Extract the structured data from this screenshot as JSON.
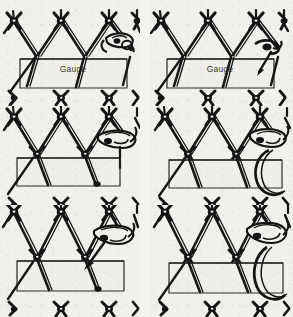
{
  "figure": {
    "type": "instructional-diagram",
    "background_color": "#f1f0ec",
    "ink_color": "#1a1a1a",
    "columns": 2,
    "rows": 3,
    "panel_count": 6
  },
  "panels": [
    {
      "id": "step-1",
      "position": "top-left",
      "gauge_label": "Gauge",
      "shows_gauge_label": true,
      "shuttle": {
        "present": true,
        "position": "right",
        "style": "flat-needle"
      },
      "arrow": {
        "present": false
      },
      "loop_around_gauge": false,
      "mesh_columns": 3,
      "bottom_knot_row": true
    },
    {
      "id": "step-2",
      "position": "top-right",
      "gauge_label": "Gauge",
      "shows_gauge_label": true,
      "shuttle": {
        "present": false
      },
      "arrow": {
        "present": true,
        "direction": "down-left",
        "note": "thread pulled down through loop"
      },
      "loop_around_gauge": false,
      "mesh_columns": 3,
      "bottom_knot_row": true
    },
    {
      "id": "step-3",
      "position": "middle-left",
      "gauge_label": "",
      "shows_gauge_label": false,
      "shuttle": {
        "present": true,
        "position": "upper-right",
        "style": "flat-needle"
      },
      "arrow": {
        "present": false
      },
      "loop_around_gauge": false,
      "mesh_columns": 3,
      "bottom_knot_row": true
    },
    {
      "id": "step-4",
      "position": "middle-right",
      "gauge_label": "",
      "shows_gauge_label": false,
      "shuttle": {
        "present": true,
        "position": "upper-right",
        "style": "flat-needle"
      },
      "arrow": {
        "present": false
      },
      "loop_around_gauge": true,
      "mesh_columns": 3,
      "bottom_knot_row": true
    },
    {
      "id": "step-5",
      "position": "bottom-left",
      "gauge_label": "",
      "shows_gauge_label": false,
      "shuttle": {
        "present": true,
        "position": "upper-right",
        "style": "flat-needle"
      },
      "arrow": {
        "present": true,
        "direction": "down-left",
        "note": "thread drawn through to tighten knot"
      },
      "loop_around_gauge": false,
      "mesh_columns": 3,
      "bottom_knot_row": true
    },
    {
      "id": "step-6",
      "position": "bottom-right",
      "gauge_label": "",
      "shows_gauge_label": false,
      "shuttle": {
        "present": true,
        "position": "upper-right",
        "style": "flat-needle"
      },
      "arrow": {
        "present": false
      },
      "loop_around_gauge": true,
      "mesh_columns": 3,
      "bottom_knot_row": true
    }
  ]
}
